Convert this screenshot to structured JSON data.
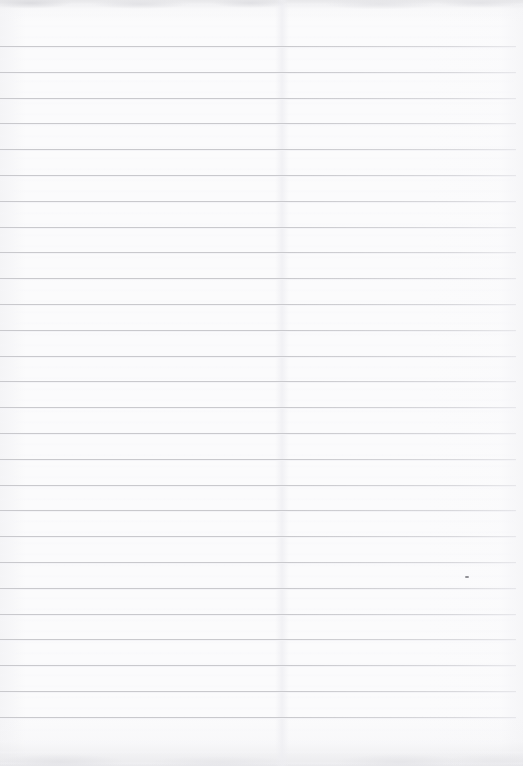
{
  "document": {
    "kind": "scanned-lined-paper",
    "title": "Blank Ruled Notebook Page",
    "page_width": 523,
    "page_height": 766,
    "content_text": "",
    "is_blank": true
  },
  "colors": {
    "page_background": "#fbfbfc",
    "rule_line": "#c9c9cd",
    "rule_line_faded": "#d8d8dc",
    "scan_edge_shadow": "#e2e2e6",
    "speck": "#8e8e93"
  },
  "ruling": {
    "line_count": 27,
    "first_line_y": 46,
    "spacing": 25.8,
    "line_thickness": 1,
    "left_x": 0,
    "right_x": 516,
    "bottom_margin_px": 50
  },
  "artifacts": {
    "fold_seam_x": 282,
    "speck": {
      "x": 465,
      "y": 576,
      "width": 4,
      "height": 2
    }
  }
}
